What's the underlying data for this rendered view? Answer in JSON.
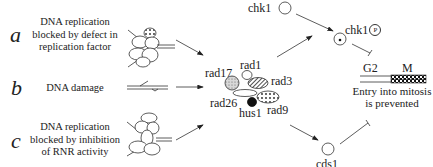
{
  "rows": [
    {
      "letter": "a",
      "description_lines": [
        "DNA replication",
        "blocked by defect in",
        "replication factor"
      ]
    },
    {
      "letter": "b",
      "description_lines": [
        "DNA damage"
      ]
    },
    {
      "letter": "c",
      "description_lines": [
        "DNA replication",
        "blocked by inhibition",
        "of RNR activity"
      ]
    }
  ],
  "checkpoint_complex": {
    "proteins": [
      "rad1",
      "rad17",
      "rad3",
      "rad26",
      "hus1",
      "rad9"
    ]
  },
  "kinases": {
    "chk1": "chk1",
    "chk1_phospho": "chk1",
    "phospho_mark": "P",
    "cds1": "cds1"
  },
  "cell_cycle": {
    "g2_label": "G2",
    "m_label": "M",
    "outcome_lines": [
      "Entry into mitosis",
      "is prevented"
    ]
  },
  "colors": {
    "ink": "#222222",
    "background": "#ffffff"
  }
}
